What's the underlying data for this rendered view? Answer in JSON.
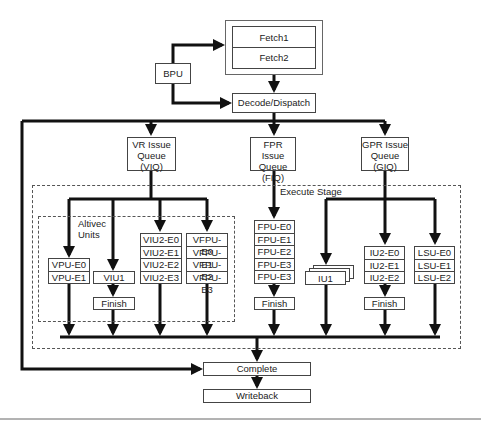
{
  "diagram": {
    "fetch": {
      "stages": [
        "Fetch1",
        "Fetch2"
      ]
    },
    "bpu": {
      "label": "BPU"
    },
    "decode": {
      "label": "Decode/Dispatch"
    },
    "queues": [
      {
        "id": "viq",
        "lines": [
          "VR Issue",
          "Queue",
          "(VIQ)"
        ]
      },
      {
        "id": "fiq",
        "lines": [
          "FPR Issue",
          "Queue",
          "(FIQ)"
        ]
      },
      {
        "id": "giq",
        "lines": [
          "GPR Issue",
          "Queue",
          "(GIQ)"
        ]
      }
    ],
    "execute_stage": {
      "label": "Execute Stage"
    },
    "altivec": {
      "label_lines": [
        "Altivec",
        "Units"
      ]
    },
    "units": {
      "vpu": [
        "VPU-E0",
        "VPU-E1"
      ],
      "viu1": [
        "VIU1"
      ],
      "viu2": [
        "VIU2-E0",
        "VIU2-E1",
        "VIU2-E2",
        "VIU2-E3"
      ],
      "vfpu": [
        "VFPU-E0",
        "VFPU-E1",
        "VFPU-E2",
        "VFPU-E3"
      ],
      "fpu": [
        "FPU-E0",
        "FPU-E1",
        "FPU-E2",
        "FPU-E3",
        "FPU-E3"
      ],
      "iu1": [
        "IU1"
      ],
      "iu2": [
        "IU2-E0",
        "IU2-E1",
        "IU2-E2"
      ],
      "lsu": [
        "LSU-E0",
        "LSU-E1",
        "LSU-E2"
      ]
    },
    "finish": {
      "label": "Finish"
    },
    "complete": {
      "label": "Complete"
    },
    "writeback": {
      "label": "Writeback"
    }
  }
}
